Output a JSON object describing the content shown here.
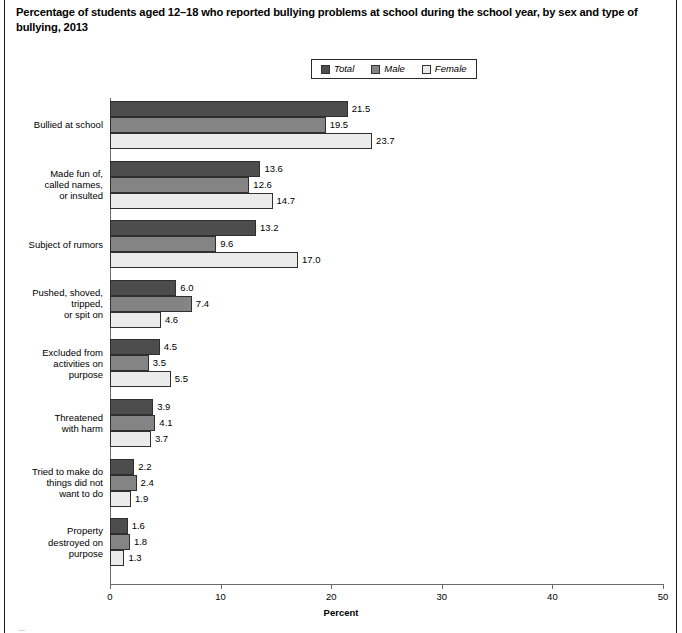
{
  "title": "Percentage of students aged 12–18 who reported bullying problems at school during the school year, by sex and type of bullying, 2013",
  "bottom_clipped_text": "—",
  "legend": {
    "items": [
      {
        "label": "Total",
        "color": "#4d4d4d"
      },
      {
        "label": "Male",
        "color": "#848484"
      },
      {
        "label": "Female",
        "color": "#ebebeb"
      }
    ]
  },
  "chart_data": {
    "type": "bar",
    "orientation": "horizontal",
    "title": "Percentage of students aged 12–18 who reported bullying problems at school during the school year, by sex and type of bullying, 2013",
    "xlabel": "Percent",
    "ylabel": "Type of bullying",
    "xlim": [
      0,
      50
    ],
    "xticks": [
      0,
      10,
      20,
      30,
      40,
      50
    ],
    "xtick_labels": [
      "0",
      "10",
      "20",
      "30",
      "40",
      "50"
    ],
    "grid": false,
    "legend_position": "top-center",
    "categories": [
      "Bullied at school",
      "Made fun of,\ncalled names,\nor insulted",
      "Subject of rumors",
      "Pushed, shoved,\ntripped,\nor spit on",
      "Excluded from\nactivities on\npurpose",
      "Threatened\nwith harm",
      "Tried to make do\nthings did not\nwant to do",
      "Property\ndestroyed on\npurpose"
    ],
    "series": [
      {
        "name": "Total",
        "color": "#4d4d4d",
        "values": [
          21.5,
          13.6,
          13.2,
          6.0,
          4.5,
          3.9,
          2.2,
          1.6
        ]
      },
      {
        "name": "Male",
        "color": "#848484",
        "values": [
          19.5,
          12.6,
          9.6,
          7.4,
          3.5,
          4.1,
          2.4,
          1.8
        ]
      },
      {
        "name": "Female",
        "color": "#ebebeb",
        "values": [
          23.7,
          14.7,
          17.0,
          4.6,
          5.5,
          3.7,
          1.9,
          1.3
        ]
      }
    ],
    "value_labels": [
      [
        "21.5",
        "19.5",
        "23.7"
      ],
      [
        "13.6",
        "12.6",
        "14.7"
      ],
      [
        "13.2",
        "9.6",
        "17.0"
      ],
      [
        "6.0",
        "7.4",
        "4.6"
      ],
      [
        "4.5",
        "3.5",
        "5.5"
      ],
      [
        "3.9",
        "4.1",
        "3.7"
      ],
      [
        "2.2",
        "2.4",
        "1.9"
      ],
      [
        "1.6",
        "1.8",
        "1.3"
      ]
    ]
  }
}
